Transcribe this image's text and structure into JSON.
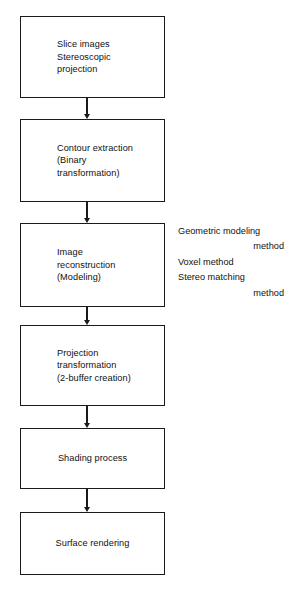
{
  "diagram": {
    "background_color": "#ffffff",
    "stroke_color": "#1a1a1a",
    "nodes": [
      {
        "id": "slice-images",
        "label": "Slice images\nStereoscopic\nprojection",
        "align": "left",
        "x": 20,
        "y": 16,
        "width": 145,
        "height": 82
      },
      {
        "id": "contour-extraction",
        "label": "Contour extraction\n(Binary\ntransformation)",
        "align": "left",
        "x": 20,
        "y": 119,
        "width": 145,
        "height": 83
      },
      {
        "id": "image-reconstruction",
        "label": "Image\nreconstruction\n(Modeling)",
        "align": "left",
        "x": 20,
        "y": 223,
        "width": 145,
        "height": 84
      },
      {
        "id": "projection-transformation",
        "label": "Projection\ntransformation\n(2-buffer creation)",
        "align": "left",
        "x": 20,
        "y": 325,
        "width": 145,
        "height": 81
      },
      {
        "id": "shading-process",
        "label": "Shading process",
        "align": "center",
        "x": 20,
        "y": 428,
        "width": 145,
        "height": 61
      },
      {
        "id": "surface-rendering",
        "label": "Surface rendering",
        "align": "center",
        "x": 20,
        "y": 512,
        "width": 145,
        "height": 63
      }
    ],
    "connectors": [
      {
        "id": "arrow-1",
        "from": "slice-images",
        "to": "contour-extraction",
        "x": 87,
        "y": 98,
        "height": 21
      },
      {
        "id": "arrow-2",
        "from": "contour-extraction",
        "to": "image-reconstruction",
        "x": 87,
        "y": 202,
        "height": 21
      },
      {
        "id": "arrow-3",
        "from": "image-reconstruction",
        "to": "projection-transformation",
        "x": 87,
        "y": 307,
        "height": 18
      },
      {
        "id": "arrow-4",
        "from": "projection-transformation",
        "to": "shading-process",
        "x": 87,
        "y": 406,
        "height": 22
      },
      {
        "id": "arrow-5",
        "from": "shading-process",
        "to": "surface-rendering",
        "x": 87,
        "y": 489,
        "height": 23
      }
    ],
    "annotation": {
      "id": "modeling-methods-note",
      "related_node": "image-reconstruction",
      "lines": [
        {
          "text": "Geometric modeling",
          "align": "left"
        },
        {
          "text": "method",
          "align": "right"
        },
        {
          "text": "Voxel method",
          "align": "left"
        },
        {
          "text": "Stereo matching",
          "align": "left"
        },
        {
          "text": "method",
          "align": "right"
        }
      ]
    }
  }
}
